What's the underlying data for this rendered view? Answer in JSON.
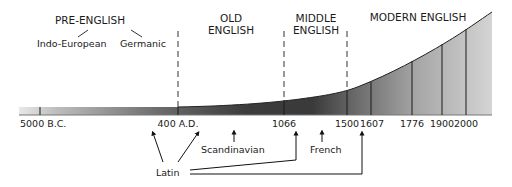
{
  "diagram": {
    "periods": [
      {
        "id": "pre-english",
        "lines": [
          "PRE-ENGLISH"
        ],
        "x": 90,
        "y": 24
      },
      {
        "id": "old-english",
        "lines": [
          "OLD",
          "ENGLISH"
        ],
        "x": 230,
        "y": 24
      },
      {
        "id": "middle-english",
        "lines": [
          "MIDDLE",
          "ENGLISH"
        ],
        "x": 316,
        "y": 24
      },
      {
        "id": "modern-english",
        "lines": [
          "MODERN ENGLISH"
        ],
        "x": 418,
        "y": 20
      }
    ],
    "pre_english_branches": {
      "left": "Indo-European",
      "right": "Germanic"
    },
    "timeline": {
      "ticks": [
        {
          "label": "5000 B.C.",
          "x": 40
        },
        {
          "label": "400 A.D.",
          "x": 178
        },
        {
          "label": "1066",
          "x": 284
        },
        {
          "label": "1500",
          "x": 347
        },
        {
          "label": "1607",
          "x": 371
        },
        {
          "label": "1776",
          "x": 412
        },
        {
          "label": "1900",
          "x": 442
        },
        {
          "label": "2000",
          "x": 466
        }
      ],
      "dashed_dividers_at": [
        "400 A.D.",
        "1066",
        "1500"
      ]
    },
    "influences": {
      "latin": "Latin",
      "scandinavian": "Scandinavian",
      "french": "French"
    },
    "colors": {
      "bar_dark": "#3a3a3a",
      "bar_light": "#e6e6e6",
      "line": "#1a1a1a",
      "background": "#ffffff"
    }
  }
}
